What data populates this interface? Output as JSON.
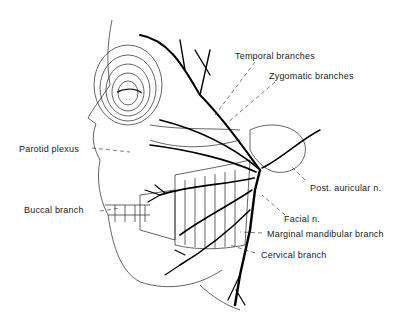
{
  "diagram": {
    "labels": {
      "temporal": "Temporal branches",
      "zygomatic": "Zygomatic branches",
      "parotid": "Parotid plexus",
      "buccal": "Buccal branch",
      "post_auricular": "Post. auricular n.",
      "facial": "Facial n.",
      "marginal_mandibular": "Marginal mandibular branch",
      "cervical": "Cervical branch"
    },
    "colors": {
      "ink": "#111111",
      "background": "#ffffff"
    }
  }
}
